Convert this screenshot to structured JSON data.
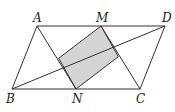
{
  "diagram": {
    "type": "geometry",
    "points": {
      "A": {
        "label": "A",
        "x": 37,
        "y": 26
      },
      "M": {
        "label": "M",
        "x": 101,
        "y": 26
      },
      "D": {
        "label": "D",
        "x": 165,
        "y": 26
      },
      "B": {
        "label": "B",
        "x": 12,
        "y": 89
      },
      "N": {
        "label": "N",
        "x": 76,
        "y": 89
      },
      "C": {
        "label": "C",
        "x": 140,
        "y": 89
      }
    },
    "segments": [
      [
        "A",
        "D"
      ],
      [
        "B",
        "C"
      ],
      [
        "A",
        "B"
      ],
      [
        "D",
        "C"
      ],
      [
        "A",
        "N"
      ],
      [
        "M",
        "C"
      ],
      [
        "B",
        "D"
      ]
    ],
    "shaded_region": {
      "vertices": [
        "M",
        "P",
        "N",
        "Q"
      ],
      "fill": "#d4d4d4"
    },
    "colors": {
      "stroke": "#333333",
      "shade": "#d4d4d4"
    }
  }
}
